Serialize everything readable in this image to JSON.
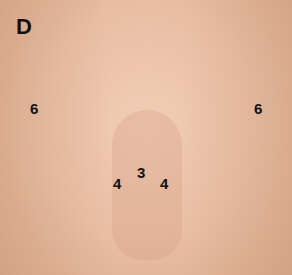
{
  "figure": {
    "panel_label": "D",
    "markers": [
      {
        "label": "6",
        "x": 30,
        "y": 100
      },
      {
        "label": "6",
        "x": 254,
        "y": 100
      },
      {
        "label": "3",
        "x": 137,
        "y": 164
      },
      {
        "label": "4",
        "x": 113,
        "y": 175
      },
      {
        "label": "4",
        "x": 160,
        "y": 175
      }
    ],
    "colors": {
      "skin_light": "#f1cdb5",
      "skin_mid": "#e9bea3",
      "skin_shadow": "#d9a98c",
      "label_color": "#111111"
    }
  }
}
